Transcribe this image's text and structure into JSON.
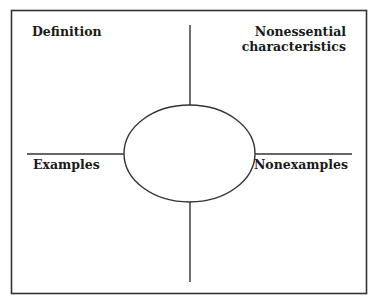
{
  "diagram": {
    "type": "frayer-model",
    "colors": {
      "background": "#ffffff",
      "stroke": "#333333",
      "text": "#1a1a1a"
    },
    "quadrants": {
      "top_left": {
        "label": "Definition"
      },
      "top_right": {
        "label_line1": "Nonessential",
        "label_line2": "characteristics"
      },
      "bottom_left": {
        "label": "Examples"
      },
      "bottom_right": {
        "label": "Nonexamples"
      }
    },
    "center": {
      "shape": "ellipse",
      "text": ""
    }
  }
}
